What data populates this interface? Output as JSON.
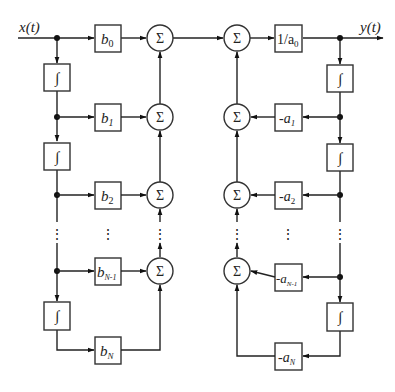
{
  "diagram": {
    "type": "block-diagram",
    "input_label": "x(t)",
    "output_label": "y(t)",
    "integrator_symbol": "∫",
    "sum_symbol": "Σ",
    "output_gain_label": "1/a",
    "output_gain_sub": "0",
    "feedforward": [
      {
        "base": "b",
        "sub": "0"
      },
      {
        "base": "b",
        "sub": "1"
      },
      {
        "base": "b",
        "sub": "2"
      },
      {
        "base": "b",
        "sub": "N-1"
      },
      {
        "base": "b",
        "sub": "N"
      }
    ],
    "feedback": [
      {
        "base": "-a",
        "sub": "1"
      },
      {
        "base": "-a",
        "sub": "2"
      },
      {
        "base": "-a",
        "sub": "N-1"
      },
      {
        "base": "-a",
        "sub": "N"
      }
    ],
    "ellipsis": "⋮"
  },
  "caption": {
    "text": "",
    "note": "caption clipped at image edge; text not legible"
  }
}
